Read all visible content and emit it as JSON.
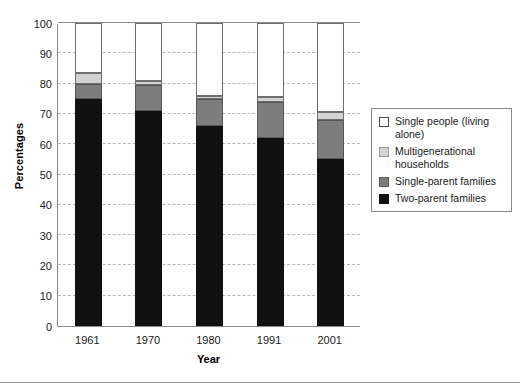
{
  "chart_data": {
    "type": "bar",
    "subtype": "stacked-bar",
    "title": "",
    "xlabel": "Year",
    "ylabel": "Percentages",
    "categories": [
      "1961",
      "1970",
      "1980",
      "1991",
      "2001"
    ],
    "ylim": [
      0,
      100
    ],
    "yticks": [
      0,
      10,
      20,
      30,
      40,
      50,
      60,
      70,
      80,
      90,
      100
    ],
    "ytick_labels": [
      "0",
      "10",
      "20",
      "30",
      "40",
      "50",
      "60",
      "70",
      "80",
      "90",
      "100"
    ],
    "grid": true,
    "grid_axis": "y",
    "grid_style": "dashed",
    "legend_position": "right-outside",
    "stack_order_bottom_to_top": [
      "Two-parent families",
      "Single-parent families",
      "Multigenerational households",
      "Single people (living alone)"
    ],
    "series": [
      {
        "name": "Two-parent families",
        "color": "#111111",
        "values": [
          75,
          71,
          66,
          62,
          55
        ]
      },
      {
        "name": "Single-parent families",
        "color": "#7d7d7d",
        "values": [
          5,
          8.5,
          9,
          12,
          13
        ]
      },
      {
        "name": "Multigenerational households",
        "color": "#d2d2d2",
        "values": [
          3.5,
          1.5,
          1,
          1.5,
          2.5
        ]
      },
      {
        "name": "Single people (living alone)",
        "color": "#ffffff",
        "values": [
          16.5,
          19,
          24,
          24.5,
          29.5
        ]
      }
    ],
    "cumulative_tops": [
      {
        "category": "1961",
        "two_parent": 75,
        "single_parent": 80,
        "multigen": 83.5,
        "single_people": 100
      },
      {
        "category": "1970",
        "two_parent": 71,
        "single_parent": 79.5,
        "multigen": 81,
        "single_people": 100
      },
      {
        "category": "1980",
        "two_parent": 66,
        "single_parent": 75,
        "multigen": 76,
        "single_people": 100
      },
      {
        "category": "1991",
        "two_parent": 62,
        "single_parent": 74,
        "multigen": 75.5,
        "single_people": 100
      },
      {
        "category": "2001",
        "two_parent": 55,
        "single_parent": 68,
        "multigen": 70.5,
        "single_people": 100
      }
    ]
  },
  "legend": {
    "items": [
      {
        "label": "Single people (living alone)",
        "swatch": "white-swatch"
      },
      {
        "label": "Multigenerational households",
        "swatch": "light-gray-swatch"
      },
      {
        "label": "Single-parent families",
        "swatch": "medium-gray-swatch"
      },
      {
        "label": "Two-parent families",
        "swatch": "black-swatch"
      }
    ]
  },
  "axes": {
    "y_title": "Percentages",
    "x_title": "Year"
  }
}
